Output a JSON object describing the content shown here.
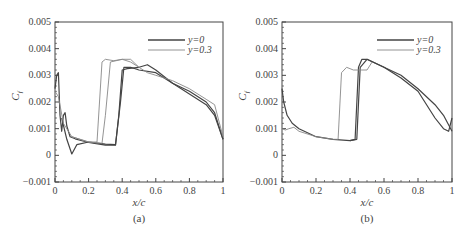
{
  "chart_data": [
    {
      "type": "line",
      "caption": "(a)",
      "xlabel": "x/c",
      "ylabel": "Cf",
      "xlim": [
        0,
        1
      ],
      "ylim": [
        -0.001,
        0.005
      ],
      "xticks": [
        "0",
        "0.2",
        "0.4",
        "0.6",
        "0.8",
        "1"
      ],
      "yticks": [
        "-0.001",
        "0",
        "0.001",
        "0.002",
        "0.003",
        "0.004",
        "0.005"
      ],
      "legend": {
        "position": "upper right",
        "entries": [
          "y=0",
          "y=0.3"
        ]
      },
      "grid": false,
      "series": [
        {
          "name": "y=0",
          "color": "#444444",
          "curves": [
            {
              "x": [
                0,
                0.01,
                0.02,
                0.03,
                0.04,
                0.05,
                0.06,
                0.07,
                0.09,
                0.12,
                0.2,
                0.3,
                0.36,
                0.38,
                0.4,
                0.43,
                0.5,
                0.55,
                0.6,
                0.7,
                0.8,
                0.9,
                0.95,
                1.0
              ],
              "y": [
                0.0025,
                0.003,
                0.0031,
                0.0015,
                0.0009,
                0.0015,
                0.0016,
                0.0011,
                0.0007,
                0.00062,
                0.00048,
                0.00038,
                0.00038,
                0.0015,
                0.0032,
                0.00325,
                0.0033,
                0.0034,
                0.0032,
                0.0027,
                0.0023,
                0.0019,
                0.0015,
                0.0006
              ]
            },
            {
              "x": [
                0.04,
                0.07,
                0.1,
                0.13,
                0.2,
                0.3,
                0.36,
                0.39,
                0.41,
                0.45,
                0.5,
                0.6,
                0.7,
                0.8,
                0.9,
                0.95,
                1.0
              ],
              "y": [
                0.0014,
                0.0006,
                5e-05,
                0.0004,
                0.0005,
                0.00042,
                0.0004,
                0.002,
                0.0033,
                0.0033,
                0.0032,
                0.0031,
                0.0027,
                0.0024,
                0.002,
                0.0016,
                0.0006
              ]
            }
          ]
        },
        {
          "name": "y=0.3",
          "color": "#888888",
          "curves": [
            {
              "x": [
                0.0,
                0.02,
                0.05,
                0.1,
                0.2,
                0.25,
                0.28,
                0.3,
                0.35,
                0.4,
                0.45,
                0.5,
                0.55,
                0.6,
                0.7,
                0.8,
                0.9,
                0.95,
                1.0
              ],
              "y": [
                0.0024,
                0.0022,
                0.0012,
                0.0007,
                0.0005,
                0.0005,
                0.0035,
                0.0036,
                0.00355,
                0.0036,
                0.0035,
                0.0033,
                0.0031,
                0.003,
                0.0028,
                0.0025,
                0.0021,
                0.0019,
                0.0007
              ]
            },
            {
              "x": [
                0.1,
                0.2,
                0.28,
                0.3,
                0.33,
                0.4,
                0.45,
                0.5
              ],
              "y": [
                0.0007,
                0.0005,
                0.00045,
                0.0015,
                0.0035,
                0.0036,
                0.0036,
                0.0033
              ]
            }
          ]
        }
      ]
    },
    {
      "type": "line",
      "caption": "(b)",
      "xlabel": "x/c",
      "ylabel": "Cf",
      "xlim": [
        0,
        1
      ],
      "ylim": [
        -0.001,
        0.005
      ],
      "xticks": [
        "0",
        "0.2",
        "0.4",
        "0.6",
        "0.8",
        "1"
      ],
      "yticks": [
        "-0.001",
        "0",
        "0.001",
        "0.002",
        "0.003",
        "0.004",
        "0.005"
      ],
      "legend": {
        "position": "upper right",
        "entries": [
          "y=0",
          "y=0.3"
        ]
      },
      "grid": false,
      "series": [
        {
          "name": "y=0",
          "color": "#444444",
          "curves": [
            {
              "x": [
                0.0,
                0.01,
                0.03,
                0.06,
                0.1,
                0.2,
                0.3,
                0.4,
                0.43,
                0.45,
                0.47,
                0.5,
                0.6,
                0.7,
                0.8,
                0.9,
                0.95,
                0.98,
                1.0
              ],
              "y": [
                0.0025,
                0.002,
                0.0015,
                0.0012,
                0.001,
                0.0007,
                0.0006,
                0.00055,
                0.0006,
                0.0033,
                0.0036,
                0.0036,
                0.0033,
                0.0029,
                0.0024,
                0.0014,
                0.001,
                0.0009,
                0.0014
              ]
            },
            {
              "x": [
                0.4,
                0.44,
                0.46,
                0.5,
                0.6,
                0.7,
                0.8,
                0.9,
                0.95,
                1.0
              ],
              "y": [
                0.00055,
                0.0006,
                0.0033,
                0.0036,
                0.0033,
                0.003,
                0.0025,
                0.0019,
                0.0015,
                0.0009
              ]
            }
          ]
        },
        {
          "name": "y=0.3",
          "color": "#888888",
          "curves": [
            {
              "x": [
                0.0,
                0.02,
                0.04,
                0.07,
                0.1,
                0.2,
                0.3,
                0.33,
                0.35,
                0.38,
                0.42,
                0.47,
                0.5,
                0.53
              ],
              "y": [
                0.001,
                0.00095,
                0.001,
                0.00105,
                0.0009,
                0.0007,
                0.0006,
                0.0006,
                0.0031,
                0.0033,
                0.0032,
                0.0032,
                0.0032,
                0.0035
              ]
            }
          ]
        }
      ]
    }
  ]
}
